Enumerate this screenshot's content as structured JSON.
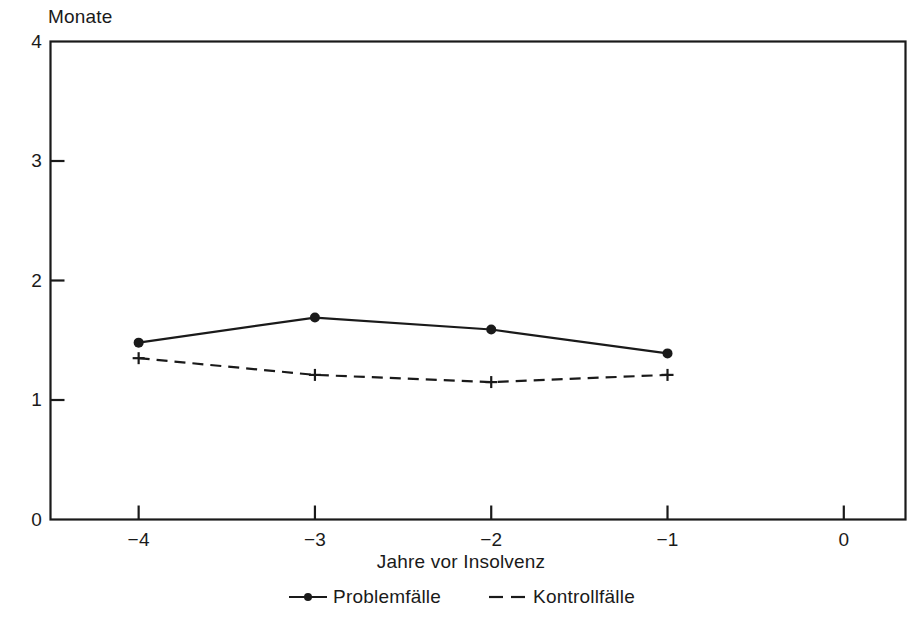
{
  "chart_data": {
    "type": "line",
    "title": "",
    "ylabel": "Monate",
    "xlabel": "Jahre vor Insolvenz",
    "x": [
      -4,
      -3,
      -2,
      -1
    ],
    "xtick_labels": [
      "−4",
      "−3",
      "−2",
      "−1",
      "0"
    ],
    "xtick_values": [
      -4,
      -3,
      -2,
      -1,
      0
    ],
    "ytick_labels": [
      "0",
      "1",
      "2",
      "3",
      "4"
    ],
    "ytick_values": [
      0,
      1,
      2,
      3,
      4
    ],
    "xlim": [
      -4.5,
      0.35
    ],
    "ylim": [
      0,
      4
    ],
    "grid": false,
    "legend_position": "bottom-center",
    "series": [
      {
        "name": "Problemfälle",
        "values": [
          1.48,
          1.69,
          1.59,
          1.39
        ],
        "line_style": "solid",
        "marker": "filled-circle",
        "color": "#1a1a1a"
      },
      {
        "name": "Kontrollfälle",
        "values": [
          1.35,
          1.21,
          1.15,
          1.21
        ],
        "line_style": "dashed",
        "marker": "plus",
        "color": "#1a1a1a"
      }
    ]
  },
  "axes": {
    "y_axis_title": "Monate",
    "x_axis_title": "Jahre vor Insolvenz",
    "y_ticks": [
      {
        "label": "4",
        "value": 4
      },
      {
        "label": "3",
        "value": 3
      },
      {
        "label": "2",
        "value": 2
      },
      {
        "label": "1",
        "value": 1
      },
      {
        "label": "0",
        "value": 0
      }
    ],
    "x_ticks": [
      {
        "label": "−4",
        "value": -4
      },
      {
        "label": "−3",
        "value": -3
      },
      {
        "label": "−2",
        "value": -2
      },
      {
        "label": "−1",
        "value": -1
      },
      {
        "label": "0",
        "value": 0
      }
    ]
  },
  "legend": {
    "items": [
      {
        "label": "Problemfälle",
        "style": "solid-with-dot"
      },
      {
        "label": "Kontrollfälle",
        "style": "dashed"
      }
    ]
  },
  "colors": {
    "ink": "#1a1a1a",
    "background": "#ffffff"
  }
}
